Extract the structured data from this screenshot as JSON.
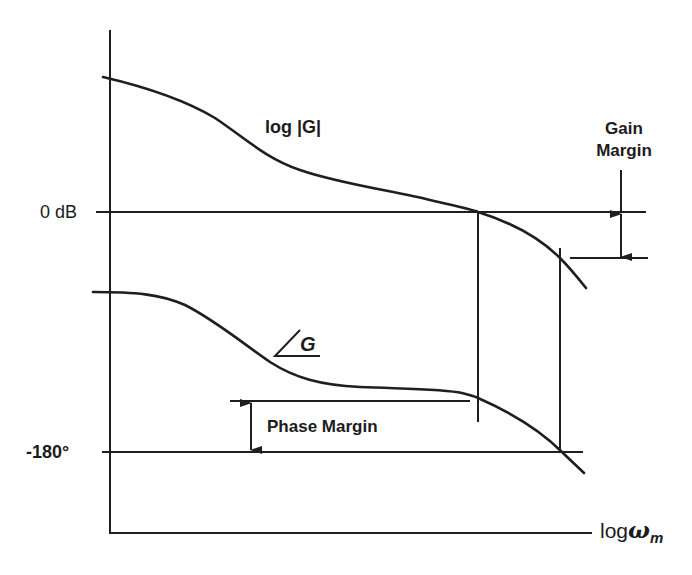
{
  "diagram": {
    "axes": {
      "x_label_prefix": "log",
      "x_label_symbol": "ω",
      "x_label_subscript": "m",
      "y_ticks": [
        {
          "label": "0 dB",
          "meaning": "magnitude reference line"
        },
        {
          "label": "-180°",
          "meaning": "phase reference line"
        }
      ]
    },
    "curves": {
      "magnitude": {
        "label": "log |G|"
      },
      "phase": {
        "label_symbol": "∠",
        "label_text": "G"
      }
    },
    "annotations": {
      "gain_margin": {
        "line1": "Gain",
        "line2": "Margin"
      },
      "phase_margin": {
        "label": "Phase Margin"
      }
    },
    "colors": {
      "line": "#1f1f1f",
      "background": "#ffffff"
    }
  }
}
